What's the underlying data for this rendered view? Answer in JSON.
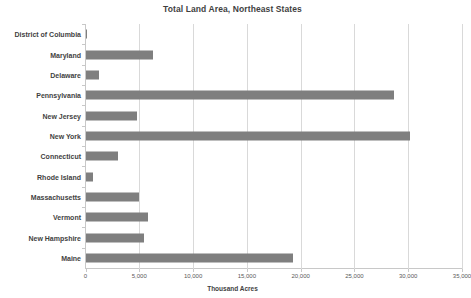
{
  "chart_data": {
    "type": "bar",
    "orientation": "horizontal",
    "title": "Total Land Area, Northeast States",
    "xlabel": "Thousand Acres",
    "ylabel": "",
    "categories": [
      "District of Columbia",
      "Maryland",
      "Delaware",
      "Pennsylvania",
      "New Jersey",
      "New York",
      "Connecticut",
      "Rhode Island",
      "Massachusetts",
      "Vermont",
      "New Hampshire",
      "Maine"
    ],
    "values": [
      40,
      6250,
      1250,
      28700,
      4800,
      30200,
      3050,
      680,
      4950,
      5850,
      5450,
      19250
    ],
    "xlim": [
      0,
      35000
    ],
    "xticks": [
      0,
      5000,
      10000,
      15000,
      20000,
      25000,
      30000,
      35000
    ],
    "xtick_labels": [
      "0",
      "5,000",
      "10,000",
      "15,000",
      "20,000",
      "25,000",
      "30,000",
      "35,000"
    ],
    "grid": true,
    "legend": false,
    "bar_color": "#7f7f7f",
    "gridline_color": "#d9d9d9",
    "axis_color": "#c8c8c8",
    "text_color": "#3f3f3f"
  }
}
